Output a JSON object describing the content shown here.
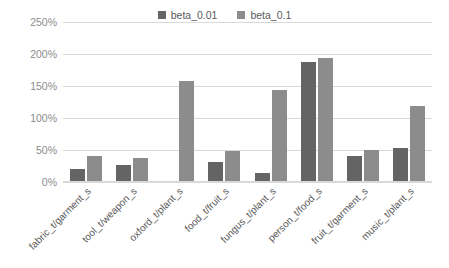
{
  "chart_data": {
    "type": "bar",
    "title": "",
    "xlabel": "",
    "ylabel": "",
    "ylim": [
      0,
      250
    ],
    "ytick_labels": [
      "250%",
      "200%",
      "150%",
      "100%",
      "50%",
      "0%"
    ],
    "ytick_values": [
      250,
      200,
      150,
      100,
      50,
      0
    ],
    "grid": true,
    "legend_position": "top-center",
    "categories": [
      "fabric_t/garment_s",
      "tool_t/weapon_s",
      "oxford_t/plant_s",
      "food_t/fruit_s",
      "fungus_t/plant_s",
      "person_t/food_s",
      "fruit_t/garment_s",
      "music_t/plant_s"
    ],
    "series": [
      {
        "name": "beta_0.01",
        "color": "#646464",
        "values": [
          21,
          27,
          2,
          32,
          14,
          187,
          41,
          53
        ]
      },
      {
        "name": "beta_0.1",
        "color": "#8c8c8c",
        "values": [
          40,
          38,
          158,
          48,
          143,
          193,
          50,
          118
        ]
      }
    ]
  },
  "colors": {
    "gridline": "#d9d9d9",
    "tick_text": "#8c8c8c",
    "label_text": "#595959",
    "background": "#ffffff"
  }
}
